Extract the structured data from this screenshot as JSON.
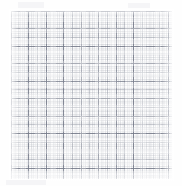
{
  "document": {
    "kind": "graph-paper-scan",
    "title": "Graph paper grid",
    "description": "Scanned sheet of square graph paper with fine dotted minor grid and darker major grid lines.",
    "background_color": "#fefefe",
    "page": {
      "width": 182,
      "height": 186
    }
  },
  "grid": {
    "name": "square-graph-grid",
    "origin_x": 11,
    "origin_y": 11,
    "width": 161,
    "height": 168,
    "minor_spacing_px": 4.36,
    "sub_spacing_px": 8.72,
    "major_spacing_px": 17.44,
    "minor_columns": 37,
    "minor_rows": 38,
    "major_columns": 9,
    "major_rows": 9,
    "minor_color": "#787e8c",
    "sub_color": "#6e7484",
    "major_color": "#585e70",
    "line_style": "dotted",
    "labels": []
  },
  "margins": {
    "left_px": 11,
    "top_px": 11,
    "right_px": 10,
    "bottom_px": 7,
    "color": "#fefefe"
  },
  "annotations": {
    "text_items": [],
    "marks": []
  }
}
